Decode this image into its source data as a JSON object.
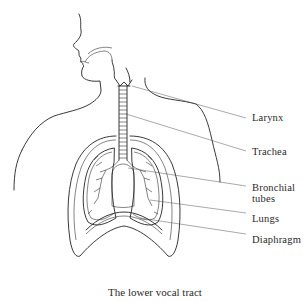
{
  "figure": {
    "caption": "The lower vocal tract",
    "labels": [
      {
        "id": "larynx",
        "text": "Larynx"
      },
      {
        "id": "trachea",
        "text": "Trachea"
      },
      {
        "id": "bronchial",
        "line1": "Bronchial",
        "line2": "tubes"
      },
      {
        "id": "lungs",
        "text": "Lungs"
      },
      {
        "id": "diaphragm",
        "text": "Diaphragm"
      }
    ]
  }
}
